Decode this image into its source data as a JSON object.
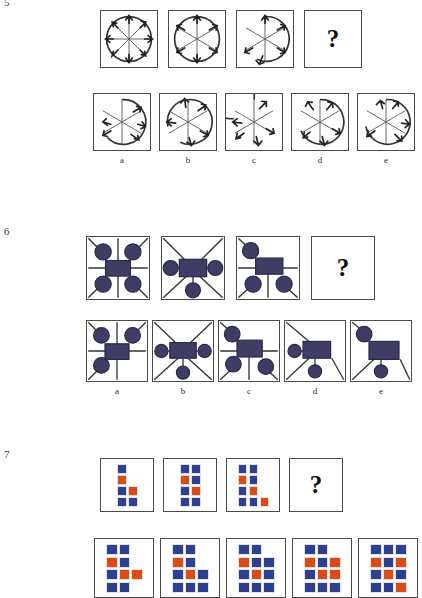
{
  "page": {
    "type": "non-verbal-reasoning-worksheet",
    "background": "#ffffff",
    "width": 422,
    "height": 584
  },
  "questions": [
    {
      "number": "5",
      "figure_type": "circle-with-arrows",
      "sequence": {
        "items": [
          {
            "id": "q5-s1",
            "spokes": 8,
            "arc": "full",
            "arrows": [
              "NW",
              "N",
              "NE",
              "E",
              "SE",
              "S",
              "SW",
              "W"
            ]
          },
          {
            "id": "q5-s2",
            "spokes": 6,
            "arc": "full",
            "arrows": [
              "N",
              "NE",
              "SE",
              "S",
              "SW",
              "W"
            ]
          },
          {
            "id": "q5-s3",
            "spokes": 6,
            "arc": "partial-bottom-gap",
            "arrows": [
              "N",
              "NE",
              "SE",
              "S",
              "SW"
            ]
          }
        ],
        "answer_box": {
          "id": "q5-answer",
          "label": "?"
        }
      },
      "options": [
        {
          "letter": "a",
          "id": "q5-opt-a",
          "spokes": 6,
          "arc": "gap-lower-left",
          "arrows": [
            "NE",
            "E",
            "SE",
            "SW",
            "W"
          ]
        },
        {
          "letter": "b",
          "id": "q5-opt-b",
          "spokes": 6,
          "arc": "gap-left",
          "arrows": [
            "N",
            "NE",
            "SE",
            "S",
            "W"
          ]
        },
        {
          "letter": "c",
          "id": "q5-opt-c",
          "spokes": 6,
          "arc": "gap-top",
          "arrows": [
            "NE",
            "SE",
            "S",
            "SW",
            "W"
          ]
        },
        {
          "letter": "d",
          "id": "q5-opt-d",
          "spokes": 6,
          "arc": "gap-upper-left",
          "arrows": [
            "N",
            "NE",
            "SE",
            "S",
            "W"
          ]
        },
        {
          "letter": "e",
          "id": "q5-opt-e",
          "spokes": 6,
          "arc": "gap-upper-left",
          "arrows": [
            "N",
            "NE",
            "SE",
            "S",
            "SW",
            "W"
          ]
        }
      ]
    },
    {
      "number": "6",
      "figure_type": "square-with-rectangle-and-circles",
      "colors": {
        "shape_fill": "#3f3d66",
        "shape_stroke": "#2b2a47",
        "frame": "#4a4a4a"
      },
      "sequence": {
        "items": [
          {
            "id": "q6-s1",
            "layout": "cross-lines",
            "circles": [
              "top-left",
              "top-right",
              "bottom-left",
              "bottom-right"
            ],
            "rect": "center"
          },
          {
            "id": "q6-s2",
            "layout": "diagonals",
            "circles": [
              "left",
              "right",
              "bottom"
            ],
            "rect": "center"
          },
          {
            "id": "q6-s3",
            "layout": "mixed",
            "circles": [
              "top-left",
              "bottom-left",
              "bottom-right"
            ],
            "rect": "center"
          }
        ],
        "answer_box": {
          "id": "q6-answer",
          "label": "?"
        }
      },
      "options": [
        {
          "letter": "a",
          "id": "q6-opt-a",
          "layout": "cross-lines",
          "circles": [
            "top-left",
            "top-right",
            "bottom-left"
          ],
          "rect": "center"
        },
        {
          "letter": "b",
          "id": "q6-opt-b",
          "layout": "diagonals",
          "circles": [
            "left",
            "right",
            "bottom"
          ],
          "rect": "center"
        },
        {
          "letter": "c",
          "id": "q6-opt-c",
          "layout": "mixed",
          "circles": [
            "top-left",
            "bottom-left",
            "bottom-right"
          ],
          "rect": "center"
        },
        {
          "letter": "d",
          "id": "q6-opt-d",
          "layout": "diagonals",
          "circles": [
            "left",
            "bottom"
          ],
          "rect": "center"
        },
        {
          "letter": "e",
          "id": "q6-opt-e",
          "layout": "diagonals",
          "circles": [
            "top-left",
            "bottom"
          ],
          "rect": "center"
        }
      ]
    },
    {
      "number": "7",
      "figure_type": "square-grid-blocks",
      "colors": {
        "blue": "#2f3f8f",
        "orange": "#d94c1a"
      },
      "legend": {
        "b": "blue",
        "o": "orange",
        "_": "empty"
      },
      "sequence": {
        "items": [
          {
            "id": "q7-s1",
            "grid": [
              [
                "b",
                "_"
              ],
              [
                "o",
                "_"
              ],
              [
                "b",
                "o"
              ],
              [
                "b",
                "b"
              ]
            ]
          },
          {
            "id": "q7-s2",
            "grid": [
              [
                "b",
                "b"
              ],
              [
                "o",
                "b"
              ],
              [
                "b",
                "o"
              ],
              [
                "b",
                "b"
              ]
            ]
          },
          {
            "id": "q7-s3",
            "grid": [
              [
                "b",
                "b",
                "_"
              ],
              [
                "o",
                "b",
                "_"
              ],
              [
                "b",
                "o",
                "_"
              ],
              [
                "b",
                "b",
                "o"
              ]
            ]
          }
        ],
        "answer_box": {
          "id": "q7-answer",
          "label": "?"
        }
      },
      "options": [
        {
          "letter": "a",
          "id": "q7-opt-a",
          "grid": [
            [
              "b",
              "b",
              "_"
            ],
            [
              "o",
              "b",
              "_"
            ],
            [
              "b",
              "o",
              "o"
            ],
            [
              "b",
              "b",
              "_"
            ]
          ]
        },
        {
          "letter": "b",
          "id": "q7-opt-b",
          "grid": [
            [
              "b",
              "b",
              "_"
            ],
            [
              "o",
              "b",
              "_"
            ],
            [
              "b",
              "o",
              "b"
            ],
            [
              "b",
              "b",
              "b"
            ]
          ]
        },
        {
          "letter": "c",
          "id": "q7-opt-c",
          "grid": [
            [
              "b",
              "b",
              "_"
            ],
            [
              "o",
              "b",
              "b"
            ],
            [
              "b",
              "o",
              "b"
            ],
            [
              "b",
              "b",
              "b"
            ]
          ]
        },
        {
          "letter": "d",
          "id": "q7-opt-d",
          "grid": [
            [
              "b",
              "b",
              "_"
            ],
            [
              "o",
              "b",
              "o"
            ],
            [
              "b",
              "o",
              "o"
            ],
            [
              "b",
              "b",
              "b"
            ]
          ]
        },
        {
          "letter": "e",
          "id": "q7-opt-e",
          "grid": [
            [
              "b",
              "b",
              "b"
            ],
            [
              "o",
              "b",
              "o"
            ],
            [
              "b",
              "o",
              "b"
            ],
            [
              "b",
              "b",
              "o"
            ]
          ]
        }
      ]
    }
  ]
}
